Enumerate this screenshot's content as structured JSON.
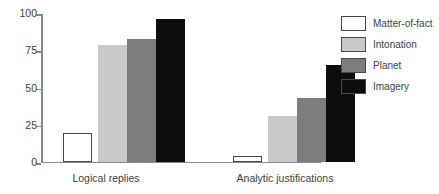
{
  "chart_data": {
    "type": "bar",
    "title": "",
    "xlabel": "",
    "ylabel": "",
    "categories": [
      "Logical replies",
      "Analytic justifications"
    ],
    "series": [
      {
        "name": "Matter-of-fact",
        "color": "#ffffff",
        "values": [
          19,
          4
        ]
      },
      {
        "name": "Intonation",
        "color": "#c9c9c9",
        "values": [
          79,
          31
        ]
      },
      {
        "name": "Planet",
        "color": "#7d7d7d",
        "values": [
          83,
          43
        ]
      },
      {
        "name": "Imagery",
        "color": "#0d0d0d",
        "values": [
          96,
          65
        ]
      }
    ],
    "ylim": [
      0,
      100
    ],
    "yticks": [
      0,
      25,
      50,
      75,
      100
    ],
    "ytick_labels": [
      "0",
      "25",
      "50",
      "75",
      "100"
    ],
    "grid": false,
    "legend_position": "right"
  },
  "axis": {
    "tick_0": "0",
    "tick_25": "25",
    "tick_50": "50",
    "tick_75": "75",
    "tick_100": "100"
  },
  "groups": {
    "group_1_label": "Logical replies",
    "group_2_label": "Analytic justifications"
  },
  "legend": {
    "item_1": "Matter-of-fact",
    "item_2": "Intonation",
    "item_3": "Planet",
    "item_4": "Imagery"
  }
}
